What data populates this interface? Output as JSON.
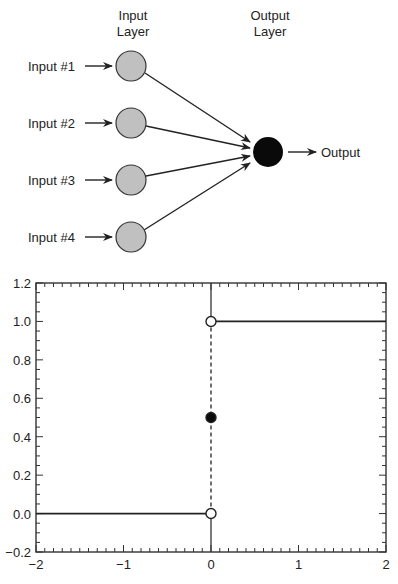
{
  "diagram": {
    "input_layer_title": [
      "Input",
      "Layer"
    ],
    "output_layer_title": [
      "Output",
      "Layer"
    ],
    "inputs": [
      {
        "label": "Input #1"
      },
      {
        "label": "Input #2"
      },
      {
        "label": "Input #3"
      },
      {
        "label": "Input #4"
      }
    ],
    "output_label": "Output",
    "colors": {
      "input_node": "#c0c0c0",
      "output_node": "#0a0a0a",
      "stroke": "#222222"
    }
  },
  "chart_data": {
    "type": "line",
    "title": "",
    "xlabel": "",
    "ylabel": "",
    "xlim": [
      -2,
      2
    ],
    "ylim": [
      -0.2,
      1.2
    ],
    "x_ticks": [
      "-2",
      "-1",
      "0",
      "1",
      "2"
    ],
    "y_ticks": [
      "-0.2",
      "0.0",
      "0.2",
      "0.4",
      "0.6",
      "0.8",
      "1.0",
      "1.2"
    ],
    "grid": false,
    "legend": null,
    "series": [
      {
        "name": "step (x<0)",
        "x": [
          -2,
          0
        ],
        "y": [
          0,
          0
        ],
        "style": "solid"
      },
      {
        "name": "step (x>0)",
        "x": [
          0,
          2
        ],
        "y": [
          1,
          1
        ],
        "style": "solid"
      },
      {
        "name": "discontinuity",
        "x": [
          0,
          0
        ],
        "y": [
          0,
          1
        ],
        "style": "dashed"
      }
    ],
    "points": [
      {
        "x": 0,
        "y": 0,
        "marker": "open-circle"
      },
      {
        "x": 0,
        "y": 1,
        "marker": "open-circle"
      },
      {
        "x": 0,
        "y": 0.5,
        "marker": "filled-circle"
      }
    ],
    "vertical_axis_line": {
      "x": 0
    }
  }
}
